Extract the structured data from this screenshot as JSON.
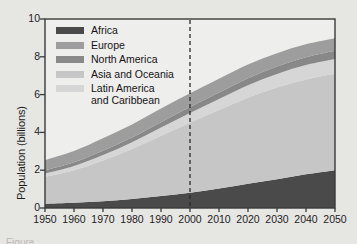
{
  "figure": {
    "background_color": "#e6e6e3",
    "plot_background_color": "#eeeeec",
    "frame_color": "#3a3a3a",
    "caption_stub": "Figure"
  },
  "axes": {
    "ylabel": "Population (billions)",
    "xlabel": "",
    "yticks": [
      "0",
      "2",
      "4",
      "6",
      "8",
      "10"
    ],
    "xticks": [
      "1950",
      "1960",
      "1970",
      "1980",
      "1990",
      "2000",
      "2010",
      "2020",
      "2030",
      "2040",
      "2050"
    ]
  },
  "legend": {
    "position": "upper-left-inside",
    "entries": [
      {
        "label": "Africa",
        "color": "#4a4a4a"
      },
      {
        "label": "Europe",
        "color": "#9d9d9d"
      },
      {
        "label": "North America",
        "color": "#888888"
      },
      {
        "label": "Asia and Oceania",
        "color": "#c6c6c6"
      },
      {
        "label": "Latin America\nand Caribbean",
        "color": "#d6d6d6"
      }
    ]
  },
  "annotations": {
    "projection_divider": {
      "x": 2000,
      "style": "dashed",
      "color": "#2b2b2b"
    }
  },
  "chart_data": {
    "type": "area",
    "title": "",
    "xlabel": "",
    "ylabel": "Population (billions)",
    "xlim": [
      1950,
      2050
    ],
    "ylim": [
      0,
      10
    ],
    "grid": false,
    "stacked": true,
    "stack_order_bottom_to_top": [
      "Africa",
      "Asia and Oceania",
      "Latin America and Caribbean",
      "North America",
      "Europe"
    ],
    "x": [
      1950,
      1960,
      1970,
      1980,
      1990,
      2000,
      2010,
      2020,
      2030,
      2040,
      2050
    ],
    "series": [
      {
        "name": "Africa",
        "color": "#4a4a4a",
        "values": [
          0.23,
          0.28,
          0.36,
          0.48,
          0.63,
          0.81,
          1.03,
          1.28,
          1.52,
          1.78,
          2.0
        ]
      },
      {
        "name": "Asia and Oceania",
        "color": "#c6c6c6",
        "values": [
          1.42,
          1.72,
          2.15,
          2.64,
          3.19,
          3.7,
          4.15,
          4.55,
          4.85,
          5.02,
          5.1
        ]
      },
      {
        "name": "Latin America and Caribbean",
        "color": "#d6d6d6",
        "values": [
          0.17,
          0.22,
          0.29,
          0.36,
          0.44,
          0.52,
          0.59,
          0.67,
          0.72,
          0.76,
          0.78
        ]
      },
      {
        "name": "North America",
        "color": "#888888",
        "values": [
          0.17,
          0.2,
          0.23,
          0.25,
          0.28,
          0.31,
          0.34,
          0.37,
          0.4,
          0.42,
          0.44
        ]
      },
      {
        "name": "Europe",
        "color": "#9d9d9d",
        "values": [
          0.55,
          0.6,
          0.66,
          0.69,
          0.72,
          0.73,
          0.73,
          0.72,
          0.7,
          0.68,
          0.66
        ]
      }
    ],
    "totals": [
      2.54,
      3.02,
      3.69,
      4.42,
      5.26,
      6.07,
      6.84,
      7.59,
      8.19,
      8.66,
      8.98
    ]
  }
}
